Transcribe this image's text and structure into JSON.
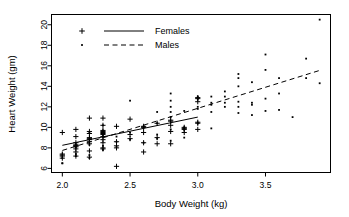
{
  "chart_data": {
    "type": "scatter",
    "title": "",
    "xlabel": "Body Weight (kg)",
    "ylabel": "Heart Weight (gm)",
    "xlim": [
      1.92,
      3.98
    ],
    "ylim": [
      5.6,
      21.0
    ],
    "xticks": [
      2.0,
      2.5,
      3.0,
      3.5
    ],
    "xtick_labels": [
      "2.0",
      "2.5",
      "3.0",
      "3.5"
    ],
    "yticks": [
      6,
      8,
      10,
      12,
      14,
      16,
      18,
      20
    ],
    "ytick_labels": [
      "6",
      "8",
      "10",
      "12",
      "14",
      "16",
      "18",
      "20"
    ],
    "grid": false,
    "legend_position": "top-left",
    "legend": [
      {
        "label": "Females",
        "marker": "plus",
        "line": "solid"
      },
      {
        "label": "Males",
        "marker": "dot",
        "line": "dashed"
      }
    ],
    "series": [
      {
        "name": "Females",
        "marker": "plus",
        "color": "#000000",
        "points": [
          [
            2.0,
            7.0
          ],
          [
            2.0,
            7.4
          ],
          [
            2.0,
            9.5
          ],
          [
            2.0,
            7.2
          ],
          [
            2.0,
            7.3
          ],
          [
            2.1,
            8.2
          ],
          [
            2.1,
            8.5
          ],
          [
            2.1,
            9.1
          ],
          [
            2.1,
            7.2
          ],
          [
            2.1,
            7.6
          ],
          [
            2.1,
            8.1
          ],
          [
            2.1,
            8.2
          ],
          [
            2.1,
            8.3
          ],
          [
            2.1,
            7.9
          ],
          [
            2.1,
            9.8
          ],
          [
            2.2,
            7.7
          ],
          [
            2.2,
            8.4
          ],
          [
            2.2,
            9.0
          ],
          [
            2.2,
            9.6
          ],
          [
            2.2,
            10.9
          ],
          [
            2.2,
            7.1
          ],
          [
            2.2,
            8.6
          ],
          [
            2.2,
            8.8
          ],
          [
            2.2,
            8.9
          ],
          [
            2.2,
            9.4
          ],
          [
            2.3,
            7.9
          ],
          [
            2.3,
            8.5
          ],
          [
            2.3,
            9.1
          ],
          [
            2.3,
            9.4
          ],
          [
            2.3,
            9.5
          ],
          [
            2.3,
            9.7
          ],
          [
            2.3,
            10.2
          ],
          [
            2.3,
            10.9
          ],
          [
            2.3,
            8.0
          ],
          [
            2.3,
            8.8
          ],
          [
            2.3,
            9.3
          ],
          [
            2.3,
            9.6
          ],
          [
            2.4,
            6.2
          ],
          [
            2.4,
            8.0
          ],
          [
            2.4,
            8.6
          ],
          [
            2.4,
            10.1
          ],
          [
            2.4,
            8.2
          ],
          [
            2.5,
            8.9
          ],
          [
            2.5,
            9.3
          ],
          [
            2.5,
            10.8
          ],
          [
            2.6,
            8.5
          ],
          [
            2.6,
            9.5
          ],
          [
            2.6,
            10.0
          ],
          [
            2.6,
            10.1
          ],
          [
            2.6,
            7.6
          ],
          [
            2.7,
            8.4
          ],
          [
            2.7,
            9.0
          ],
          [
            2.7,
            10.4
          ],
          [
            2.8,
            8.4
          ],
          [
            2.8,
            9.6
          ],
          [
            2.8,
            10.2
          ],
          [
            2.8,
            10.7
          ],
          [
            2.8,
            10.6
          ],
          [
            2.9,
            9.5
          ],
          [
            2.9,
            9.8
          ],
          [
            2.9,
            10.0
          ],
          [
            2.9,
            9.9
          ],
          [
            3.0,
            9.8
          ],
          [
            3.0,
            10.5
          ],
          [
            3.0,
            12.8
          ],
          [
            3.0,
            12.9
          ],
          [
            3.0,
            12.5
          ],
          [
            3.0,
            10.4
          ]
        ]
      },
      {
        "name": "Males",
        "marker": "dot",
        "color": "#000000",
        "points": [
          [
            2.0,
            6.5
          ],
          [
            2.0,
            6.5
          ],
          [
            2.0,
            7.0
          ],
          [
            2.1,
            7.2
          ],
          [
            2.1,
            7.4
          ],
          [
            2.1,
            8.2
          ],
          [
            2.2,
            7.0
          ],
          [
            2.2,
            7.3
          ],
          [
            2.2,
            8.3
          ],
          [
            2.2,
            9.5
          ],
          [
            2.3,
            7.8
          ],
          [
            2.3,
            8.2
          ],
          [
            2.3,
            9.1
          ],
          [
            2.3,
            9.5
          ],
          [
            2.3,
            10.2
          ],
          [
            2.4,
            8.1
          ],
          [
            2.4,
            8.6
          ],
          [
            2.4,
            9.1
          ],
          [
            2.5,
            8.8
          ],
          [
            2.5,
            9.5
          ],
          [
            2.5,
            12.6
          ],
          [
            2.6,
            8.5
          ],
          [
            2.6,
            10.0
          ],
          [
            2.6,
            10.1
          ],
          [
            2.7,
            8.9
          ],
          [
            2.7,
            9.3
          ],
          [
            2.7,
            10.4
          ],
          [
            2.7,
            11.5
          ],
          [
            2.8,
            8.7
          ],
          [
            2.8,
            9.8
          ],
          [
            2.8,
            11.5
          ],
          [
            2.8,
            12.0
          ],
          [
            2.8,
            12.6
          ],
          [
            2.8,
            13.3
          ],
          [
            2.8,
            11.0
          ],
          [
            2.9,
            9.0
          ],
          [
            2.9,
            9.8
          ],
          [
            2.9,
            10.0
          ],
          [
            2.9,
            11.6
          ],
          [
            3.0,
            10.4
          ],
          [
            3.0,
            12.0
          ],
          [
            3.0,
            12.8
          ],
          [
            3.0,
            13.0
          ],
          [
            3.0,
            11.8
          ],
          [
            3.1,
            9.9
          ],
          [
            3.1,
            11.5
          ],
          [
            3.1,
            12.2
          ],
          [
            3.1,
            12.4
          ],
          [
            3.1,
            13.0
          ],
          [
            3.2,
            12.0
          ],
          [
            3.2,
            12.4
          ],
          [
            3.2,
            13.0
          ],
          [
            3.2,
            13.5
          ],
          [
            3.3,
            11.4
          ],
          [
            3.3,
            12.0
          ],
          [
            3.3,
            12.5
          ],
          [
            3.3,
            14.0
          ],
          [
            3.3,
            14.8
          ],
          [
            3.3,
            15.2
          ],
          [
            3.4,
            11.2
          ],
          [
            3.4,
            12.2
          ],
          [
            3.4,
            12.4
          ],
          [
            3.4,
            14.4
          ],
          [
            3.5,
            11.6
          ],
          [
            3.5,
            12.8
          ],
          [
            3.5,
            15.6
          ],
          [
            3.5,
            17.1
          ],
          [
            3.6,
            11.7
          ],
          [
            3.6,
            13.3
          ],
          [
            3.6,
            14.8
          ],
          [
            3.7,
            11.0
          ],
          [
            3.8,
            14.8
          ],
          [
            3.8,
            16.7
          ],
          [
            3.9,
            14.3
          ],
          [
            3.9,
            20.5
          ]
        ]
      }
    ],
    "trend_lines": [
      {
        "name": "Females",
        "style": "solid",
        "x0": 2.0,
        "y0": 8.25,
        "x1": 3.0,
        "y1": 11.0
      },
      {
        "name": "Males",
        "style": "dashed",
        "x0": 2.0,
        "y0": 7.75,
        "x1": 3.9,
        "y1": 15.55
      }
    ]
  }
}
